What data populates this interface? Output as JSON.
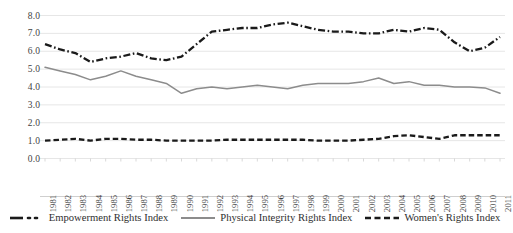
{
  "chart_data": {
    "type": "line",
    "title": "",
    "subtitle": "",
    "xlabel": "",
    "ylabel": "",
    "ylim": [
      0.0,
      8.0
    ],
    "ytick_step": 1.0,
    "ytick_labels": [
      "8.0",
      "7.0",
      "6.0",
      "5.0",
      "4.0",
      "3.0",
      "2.0",
      "1.0",
      "0.0"
    ],
    "grid": true,
    "grid_axis": "y",
    "legend_position": "bottom",
    "categories": [
      "1981",
      "1982",
      "1983",
      "1984",
      "1985",
      "1986",
      "1987",
      "1988",
      "1989",
      "1990",
      "1991",
      "1992",
      "1993",
      "1994",
      "1995",
      "1996",
      "1997",
      "1998",
      "1999",
      "2000",
      "2001",
      "2002",
      "2003",
      "2004",
      "2005",
      "2006",
      "2007",
      "2008",
      "2009",
      "2010",
      "2011"
    ],
    "series": [
      {
        "name": "Empowerment Rights Index",
        "style": "dash-dot",
        "color": "#1a1a1a",
        "values": [
          6.4,
          6.1,
          5.9,
          5.4,
          5.6,
          5.7,
          5.9,
          5.6,
          5.5,
          5.7,
          6.4,
          7.1,
          7.2,
          7.3,
          7.3,
          7.5,
          7.6,
          7.4,
          7.2,
          7.1,
          7.1,
          7.0,
          7.0,
          7.2,
          7.1,
          7.3,
          7.2,
          6.5,
          6.0,
          6.2,
          6.8
        ]
      },
      {
        "name": "Physical Integrity Rights Index",
        "style": "solid",
        "color": "#8c8c8c",
        "values": [
          5.1,
          4.9,
          4.7,
          4.4,
          4.6,
          4.9,
          4.6,
          4.4,
          4.2,
          3.65,
          3.9,
          4.0,
          3.9,
          4.0,
          4.1,
          4.0,
          3.9,
          4.1,
          4.2,
          4.2,
          4.2,
          4.3,
          4.5,
          4.2,
          4.3,
          4.1,
          4.1,
          4.0,
          4.0,
          3.95,
          3.65
        ]
      },
      {
        "name": "Women's Rights Index",
        "style": "dashed",
        "color": "#1a1a1a",
        "values": [
          1.0,
          1.05,
          1.1,
          1.0,
          1.1,
          1.1,
          1.05,
          1.05,
          1.0,
          1.0,
          1.0,
          1.0,
          1.05,
          1.05,
          1.05,
          1.05,
          1.05,
          1.05,
          1.0,
          1.0,
          1.0,
          1.05,
          1.1,
          1.25,
          1.3,
          1.2,
          1.1,
          1.3,
          1.3,
          1.3,
          1.3
        ]
      }
    ]
  },
  "legend": {
    "items": [
      {
        "label": "Empowerment Rights Index"
      },
      {
        "label": "Physical Integrity Rights Index"
      },
      {
        "label": "Women's Rights Index"
      }
    ]
  },
  "colors": {
    "grid": "#e6e6e6",
    "axis": "#cfcfcf",
    "text": "#3a3a3a",
    "series_dark": "#1a1a1a",
    "series_gray": "#8c8c8c"
  }
}
